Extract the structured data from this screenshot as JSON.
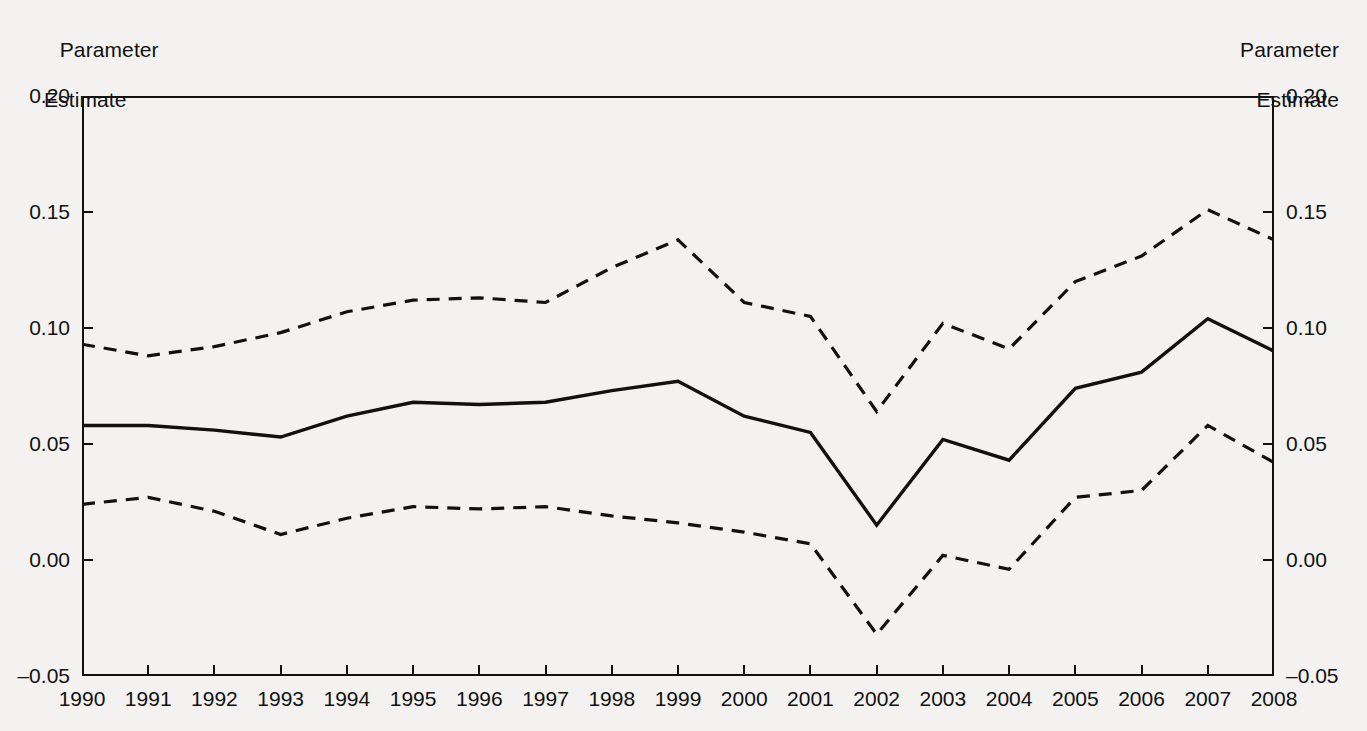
{
  "axis_titles": {
    "left_line1": "Parameter",
    "left_line2": "Estimate",
    "right_line1": "Parameter",
    "right_line2": "Estimate"
  },
  "y_axis": {
    "ticks": [
      "0.20",
      "0.15",
      "0.10",
      "0.05",
      "0.00",
      "–0.05"
    ],
    "tick_values": [
      0.2,
      0.15,
      0.1,
      0.05,
      0.0,
      -0.05
    ],
    "min": -0.05,
    "max": 0.2
  },
  "x_axis": {
    "ticks": [
      "1990",
      "1991",
      "1992",
      "1993",
      "1994",
      "1995",
      "1996",
      "1997",
      "1998",
      "1999",
      "2000",
      "2001",
      "2002",
      "2003",
      "2004",
      "2005",
      "2006",
      "2007",
      "2008"
    ]
  },
  "chart_data": {
    "type": "line",
    "title": "",
    "subtitle": "",
    "xlabel": "",
    "ylabel": "Parameter Estimate",
    "ylabel_right": "Parameter Estimate",
    "xlim": [
      1990,
      2008
    ],
    "ylim": [
      -0.05,
      0.2
    ],
    "yticks": [
      -0.05,
      0.0,
      0.05,
      0.1,
      0.15,
      0.2
    ],
    "grid": false,
    "legend": false,
    "legend_position": "none",
    "x": [
      1990,
      1991,
      1992,
      1993,
      1994,
      1995,
      1996,
      1997,
      1998,
      1999,
      2000,
      2001,
      2002,
      2003,
      2004,
      2005,
      2006,
      2007,
      2008
    ],
    "series": [
      {
        "name": "Upper confidence bound",
        "style": "dashed",
        "color": "#111111",
        "values": [
          0.093,
          0.088,
          0.092,
          0.098,
          0.107,
          0.112,
          0.113,
          0.111,
          0.126,
          0.138,
          0.111,
          0.105,
          0.064,
          0.102,
          0.091,
          0.12,
          0.131,
          0.151,
          0.138
        ]
      },
      {
        "name": "Parameter estimate",
        "style": "solid",
        "color": "#111111",
        "values": [
          0.058,
          0.058,
          0.056,
          0.053,
          0.062,
          0.068,
          0.067,
          0.068,
          0.073,
          0.077,
          0.062,
          0.055,
          0.015,
          0.052,
          0.043,
          0.074,
          0.081,
          0.104,
          0.09
        ]
      },
      {
        "name": "Lower confidence bound",
        "style": "dashed",
        "color": "#111111",
        "values": [
          0.024,
          0.027,
          0.021,
          0.011,
          0.018,
          0.023,
          0.022,
          0.023,
          0.019,
          0.016,
          0.012,
          0.007,
          -0.032,
          0.002,
          -0.004,
          0.027,
          0.03,
          0.058,
          0.042
        ]
      }
    ]
  },
  "colors": {
    "background": "#f3f2f0",
    "ink": "#111111"
  }
}
